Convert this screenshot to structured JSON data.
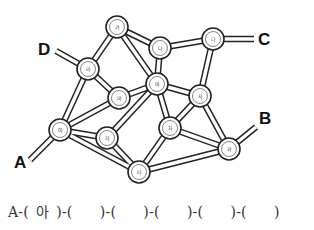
{
  "diagram": {
    "nodes": [
      {
        "id": "ga",
        "label": "가",
        "x": 117,
        "y": 27
      },
      {
        "id": "na",
        "label": "나",
        "x": 160,
        "y": 48
      },
      {
        "id": "da",
        "label": "다",
        "x": 213,
        "y": 39
      },
      {
        "id": "ra",
        "label": "라",
        "x": 88,
        "y": 69
      },
      {
        "id": "ma",
        "label": "마",
        "x": 119,
        "y": 98
      },
      {
        "id": "ba",
        "label": "바",
        "x": 157,
        "y": 84
      },
      {
        "id": "sa",
        "label": "사",
        "x": 200,
        "y": 96
      },
      {
        "id": "a",
        "label": "아",
        "x": 60,
        "y": 130
      },
      {
        "id": "ja",
        "label": "자",
        "x": 107,
        "y": 138
      },
      {
        "id": "cha",
        "label": "차",
        "x": 170,
        "y": 128
      },
      {
        "id": "ta",
        "label": "타",
        "x": 139,
        "y": 172
      },
      {
        "id": "ka",
        "label": "카",
        "x": 229,
        "y": 149
      }
    ],
    "edges": [
      [
        "ga",
        "ra"
      ],
      [
        "ga",
        "na"
      ],
      [
        "ga",
        "ba"
      ],
      [
        "na",
        "da"
      ],
      [
        "na",
        "ba"
      ],
      [
        "da",
        "sa"
      ],
      [
        "ra",
        "ma"
      ],
      [
        "ra",
        "a"
      ],
      [
        "ma",
        "ba"
      ],
      [
        "ma",
        "a"
      ],
      [
        "ba",
        "sa"
      ],
      [
        "ba",
        "ja"
      ],
      [
        "ba",
        "cha"
      ],
      [
        "sa",
        "cha"
      ],
      [
        "sa",
        "ka"
      ],
      [
        "a",
        "ja"
      ],
      [
        "a",
        "ta"
      ],
      [
        "ja",
        "ta"
      ],
      [
        "cha",
        "ta"
      ],
      [
        "cha",
        "ka"
      ],
      [
        "ta",
        "ka"
      ]
    ],
    "endpoints": [
      {
        "label": "A",
        "node": "a",
        "x2": 30,
        "y2": 160,
        "lx": 14,
        "ly": 168
      },
      {
        "label": "B",
        "node": "ka",
        "x2": 256,
        "y2": 127,
        "lx": 259,
        "ly": 124
      },
      {
        "label": "C",
        "node": "da",
        "x2": 254,
        "y2": 39,
        "lx": 258,
        "ly": 45
      },
      {
        "label": "D",
        "node": "ra",
        "x2": 56,
        "y2": 51,
        "lx": 38,
        "ly": 55
      }
    ]
  },
  "answer": {
    "start": "A-",
    "slots": [
      "아",
      "",
      "",
      "",
      "",
      ""
    ]
  }
}
